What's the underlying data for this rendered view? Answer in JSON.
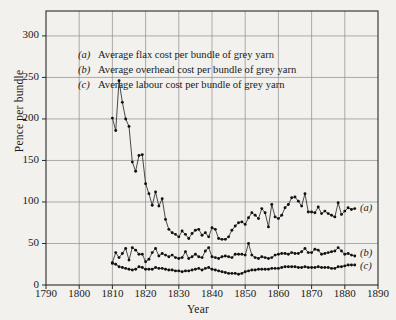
{
  "chart_data": {
    "type": "line",
    "title": "",
    "xlabel": "Year",
    "ylabel": "Pence per bundle",
    "xlim": [
      1790,
      1890
    ],
    "ylim": [
      0,
      330
    ],
    "xticks": [
      1790,
      1800,
      1810,
      1820,
      1830,
      1840,
      1850,
      1860,
      1870,
      1880,
      1890
    ],
    "yticks": [
      0,
      50,
      100,
      150,
      200,
      250,
      300
    ],
    "grid": true,
    "legend_position": "upper-left-inside",
    "marker": "filled-circle",
    "line_color": "#111111",
    "background": "#f2f1ed",
    "legend": [
      {
        "key": "(a)",
        "label": "Average flax cost per bundle of grey  yarn"
      },
      {
        "key": "(b)",
        "label": "Average overhead cost per  bundle of grey yarn"
      },
      {
        "key": "(c)",
        "label": "Average labour  cost per bundle of grey yarn"
      }
    ],
    "end_labels": [
      {
        "key": "(a)",
        "y": 92
      },
      {
        "key": "(b)",
        "y": 37
      },
      {
        "key": "(c)",
        "y": 22
      }
    ],
    "x": [
      1810,
      1811,
      1812,
      1813,
      1814,
      1815,
      1816,
      1817,
      1818,
      1819,
      1820,
      1821,
      1822,
      1823,
      1824,
      1825,
      1826,
      1827,
      1828,
      1829,
      1830,
      1831,
      1832,
      1833,
      1834,
      1835,
      1836,
      1837,
      1838,
      1839,
      1840,
      1841,
      1842,
      1843,
      1844,
      1845,
      1846,
      1847,
      1848,
      1849,
      1850,
      1851,
      1852,
      1853,
      1854,
      1855,
      1856,
      1857,
      1858,
      1859,
      1860,
      1861,
      1862,
      1863,
      1864,
      1865,
      1866,
      1867,
      1868,
      1869,
      1870,
      1871,
      1872,
      1873,
      1874,
      1875,
      1876,
      1877,
      1878,
      1879,
      1880,
      1881,
      1882,
      1883
    ],
    "series": [
      {
        "name": "(a) Average flax cost per bundle of grey yarn",
        "values": [
          201,
          186,
          246,
          220,
          200,
          191,
          148,
          137,
          156,
          157,
          122,
          110,
          96,
          112,
          95,
          104,
          79,
          67,
          63,
          61,
          58,
          65,
          61,
          56,
          62,
          66,
          67,
          60,
          63,
          58,
          69,
          67,
          56,
          55,
          55,
          58,
          66,
          71,
          75,
          76,
          73,
          81,
          87,
          84,
          80,
          92,
          87,
          70,
          97,
          82,
          80,
          84,
          93,
          97,
          105,
          106,
          101,
          95,
          110,
          88,
          88,
          87,
          94,
          86,
          89,
          86,
          84,
          82,
          99,
          85,
          89,
          93,
          91,
          92
        ]
      },
      {
        "name": "(b) Average overhead cost per bundle of grey yarn",
        "values": [
          27,
          39,
          33,
          38,
          44,
          30,
          45,
          42,
          37,
          37,
          28,
          31,
          39,
          44,
          35,
          38,
          36,
          34,
          36,
          33,
          32,
          33,
          40,
          32,
          34,
          37,
          34,
          33,
          41,
          45,
          34,
          33,
          32,
          34,
          35,
          34,
          33,
          37,
          37,
          37,
          36,
          50,
          36,
          33,
          32,
          34,
          33,
          32,
          33,
          36,
          37,
          38,
          38,
          37,
          39,
          38,
          38,
          40,
          44,
          39,
          39,
          43,
          42,
          37,
          38,
          39,
          40,
          41,
          45,
          41,
          37,
          38,
          36,
          35
        ]
      },
      {
        "name": "(c) Average labour cost per bundle of grey yarn",
        "values": [
          26,
          25,
          22,
          21,
          20,
          19,
          18,
          19,
          22,
          21,
          19,
          19,
          19,
          21,
          20,
          20,
          19,
          18,
          18,
          17,
          17,
          16,
          17,
          17,
          18,
          19,
          20,
          18,
          20,
          21,
          19,
          18,
          17,
          16,
          15,
          14,
          14,
          14,
          13,
          14,
          16,
          17,
          18,
          18,
          19,
          19,
          19,
          19,
          20,
          20,
          20,
          21,
          22,
          22,
          22,
          22,
          21,
          21,
          22,
          21,
          21,
          21,
          22,
          21,
          21,
          21,
          20,
          20,
          22,
          22,
          23,
          24,
          24,
          24
        ]
      }
    ]
  }
}
